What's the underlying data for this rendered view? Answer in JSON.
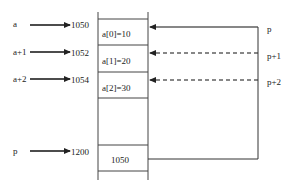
{
  "labels": {
    "left": [
      {
        "name": "a",
        "address": "1050"
      },
      {
        "name": "a+1",
        "address": "1052"
      },
      {
        "name": "a+2",
        "address": "1054"
      },
      {
        "name": "p",
        "address": "1200"
      }
    ],
    "right": [
      "p",
      "p+1",
      "p+2"
    ]
  },
  "cells": [
    "a[0]=10",
    "a[1]=20",
    "a[2]=30",
    "",
    "1050"
  ],
  "colors": {
    "line": "#222222",
    "background": "#ffffff"
  }
}
